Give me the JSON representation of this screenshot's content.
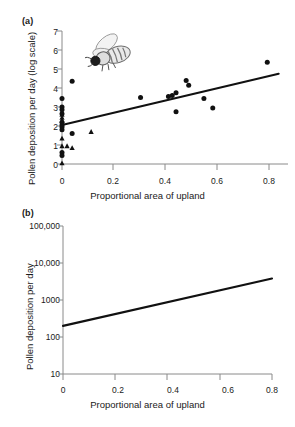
{
  "figure": {
    "panel_a_label": "(a)",
    "panel_b_label": "(b)"
  },
  "chart_data": [
    {
      "id": "panel-a",
      "type": "scatter",
      "title": "",
      "panel": "(a)",
      "xlabel": "Proportional area of upland",
      "ylabel": "Pollen deposition per day (log scale)",
      "xlim": [
        0,
        0.88
      ],
      "ylim": [
        0,
        7
      ],
      "xticks": [
        0,
        0.2,
        0.4,
        0.6,
        0.8
      ],
      "xticklabels": [
        "0",
        "0.2",
        "0.4",
        "0.6",
        "0.8"
      ],
      "yticks": [
        0,
        1,
        2,
        3,
        4,
        5,
        6,
        7
      ],
      "yticklabels": [
        "0",
        "1",
        "2",
        "3",
        "4",
        "5",
        "6",
        "7"
      ],
      "grid": false,
      "legend": "none",
      "annotation_icon": "bee-illustration",
      "series": [
        {
          "name": "Circle observations",
          "marker": "circle",
          "color": "#111111",
          "points": [
            {
              "x": 0.0,
              "y": 3.45
            },
            {
              "x": 0.0,
              "y": 3.0
            },
            {
              "x": 0.0,
              "y": 2.85
            },
            {
              "x": 0.0,
              "y": 2.65
            },
            {
              "x": 0.0,
              "y": 2.2
            },
            {
              "x": 0.0,
              "y": 2.05
            },
            {
              "x": 0.0,
              "y": 1.95
            },
            {
              "x": 0.0,
              "y": 1.8
            },
            {
              "x": 0.0,
              "y": 0.6
            },
            {
              "x": 0.0,
              "y": 0.45
            },
            {
              "x": 0.04,
              "y": 4.35
            },
            {
              "x": 0.04,
              "y": 1.6
            },
            {
              "x": 0.31,
              "y": 3.5
            },
            {
              "x": 0.42,
              "y": 3.55
            },
            {
              "x": 0.435,
              "y": 3.6
            },
            {
              "x": 0.45,
              "y": 3.75
            },
            {
              "x": 0.45,
              "y": 2.75
            },
            {
              "x": 0.49,
              "y": 4.4
            },
            {
              "x": 0.5,
              "y": 4.15
            },
            {
              "x": 0.56,
              "y": 3.45
            },
            {
              "x": 0.595,
              "y": 2.95
            },
            {
              "x": 0.81,
              "y": 5.35
            }
          ]
        },
        {
          "name": "Triangle observations",
          "marker": "triangle",
          "color": "#111111",
          "points": [
            {
              "x": 0.0,
              "y": 2.6
            },
            {
              "x": 0.0,
              "y": 2.45
            },
            {
              "x": 0.0,
              "y": 2.3
            },
            {
              "x": 0.0,
              "y": 1.35
            },
            {
              "x": 0.0,
              "y": 0.95
            },
            {
              "x": 0.0,
              "y": 0.05
            },
            {
              "x": 0.02,
              "y": 0.95
            },
            {
              "x": 0.04,
              "y": 0.85
            },
            {
              "x": 0.115,
              "y": 1.7
            }
          ]
        }
      ],
      "trendline": {
        "name": "Fitted regression line",
        "x_start": 0.0,
        "y_start": 2.05,
        "x_end": 0.855,
        "y_end": 4.75
      }
    },
    {
      "id": "panel-b",
      "type": "line",
      "panel": "(b)",
      "xlabel": "Proportional area of upland",
      "ylabel": "Pollen deposition per day",
      "xlim": [
        0,
        0.8
      ],
      "ylim": [
        10,
        100000
      ],
      "yscale": "log",
      "xticks": [
        0,
        0.2,
        0.4,
        0.6,
        0.8
      ],
      "xticklabels": [
        "0",
        "0.2",
        "0.4",
        "0.6",
        "0.8"
      ],
      "yticks": [
        10,
        100,
        1000,
        10000,
        100000
      ],
      "yticklabels": [
        "10",
        "100",
        "1000",
        "10,000",
        "100,000"
      ],
      "grid": false,
      "legend": "none",
      "series": [
        {
          "name": "Back-transformed regression",
          "color": "#111111",
          "x": [
            0,
            0.8
          ],
          "y": [
            200,
            3800
          ]
        }
      ]
    }
  ]
}
